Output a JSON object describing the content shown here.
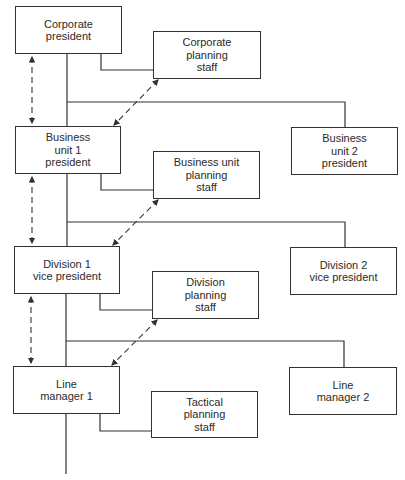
{
  "diagram": {
    "type": "org-chart",
    "levels": [
      {
        "line_box": {
          "id": "corporate-president",
          "label": "Corporate\npresident"
        },
        "staff_box": {
          "id": "corporate-planning-staff",
          "label": "Corporate\nplanning\nstaff"
        }
      },
      {
        "line_box": {
          "id": "business-unit-1-president",
          "label": "Business\nunit 1\npresident"
        },
        "peer_box": {
          "id": "business-unit-2-president",
          "label": "Business\nunit 2\npresident"
        },
        "staff_box": {
          "id": "business-unit-planning-staff",
          "label": "Business unit\nplanning\nstaff"
        }
      },
      {
        "line_box": {
          "id": "division-1-vice-president",
          "label": "Division 1\nvice president"
        },
        "peer_box": {
          "id": "division-2-vice-president",
          "label": "Division 2\nvice president"
        },
        "staff_box": {
          "id": "division-planning-staff",
          "label": "Division\nplanning\nstaff"
        }
      },
      {
        "line_box": {
          "id": "line-manager-1",
          "label": "Line\nmanager 1"
        },
        "peer_box": {
          "id": "line-manager-2",
          "label": "Line\nmanager 2"
        },
        "staff_box": {
          "id": "tactical-planning-staff",
          "label": "Tactical\nplanning\nstaff"
        }
      }
    ],
    "connections": {
      "solid": "reporting lines",
      "dashed_double_arrow": "coordination between levels"
    }
  },
  "colors": {
    "line": "#333333",
    "text": "#2a2a2a",
    "background": "#ffffff"
  }
}
